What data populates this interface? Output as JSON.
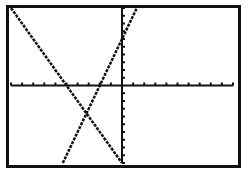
{
  "chart_data": {
    "type": "line",
    "title": "",
    "xlabel": "",
    "ylabel": "",
    "xlim": [
      -10,
      10
    ],
    "ylim": [
      -10,
      10
    ],
    "xscl": 1,
    "yscl": 1,
    "grid": false,
    "legend": "none",
    "series": [
      {
        "name": "Y1",
        "equation": "y = 3x + 6",
        "slope": 3,
        "intercept": 6
      },
      {
        "name": "Y2",
        "equation": "y = -2x - 10",
        "slope": -2,
        "intercept": -10
      }
    ],
    "intersection": {
      "x": -3.2,
      "y": -3.6
    }
  },
  "colors": {
    "background": "#ffffff",
    "ink": "#111111"
  }
}
